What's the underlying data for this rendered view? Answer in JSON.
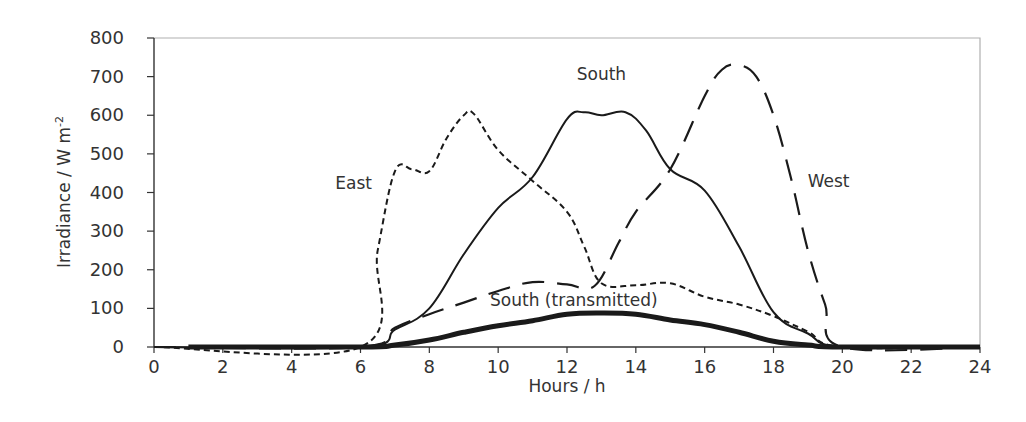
{
  "chart_data": {
    "type": "line",
    "title": "",
    "xlabel": "Hours / h",
    "ylabel": "Irradiance  / W m-2",
    "ylabel_main": "Irradiance  / W m",
    "ylabel_sup": "-2",
    "xlim": [
      0,
      24
    ],
    "ylim": [
      0,
      800
    ],
    "x_ticks": [
      0,
      2,
      4,
      6,
      8,
      10,
      12,
      14,
      16,
      18,
      20,
      22,
      24
    ],
    "y_ticks": [
      0,
      100,
      200,
      300,
      400,
      500,
      600,
      700,
      800
    ],
    "grid": false,
    "legend": "inline labels",
    "series": [
      {
        "name": "South",
        "style": "solid",
        "label_pos": [
          13,
          690
        ],
        "x": [
          0,
          6,
          7,
          8,
          9,
          10,
          11,
          12,
          12.5,
          13,
          13.7,
          14.3,
          15,
          16,
          17,
          18,
          19,
          20,
          24
        ],
        "values": [
          0,
          0,
          45,
          100,
          240,
          360,
          440,
          590,
          608,
          600,
          608,
          560,
          460,
          405,
          260,
          90,
          35,
          0,
          0
        ]
      },
      {
        "name": "East",
        "style": "short-dash",
        "label_pos": [
          5.8,
          410
        ],
        "x": [
          0,
          6,
          6.5,
          7,
          7.5,
          8,
          8.5,
          9,
          9.3,
          10,
          11,
          12,
          12.5,
          13,
          14,
          15,
          16,
          17,
          18,
          19,
          20,
          24
        ],
        "values": [
          0,
          0,
          250,
          455,
          460,
          455,
          540,
          600,
          603,
          510,
          430,
          350,
          260,
          165,
          160,
          165,
          130,
          110,
          80,
          40,
          0,
          0
        ]
      },
      {
        "name": "West",
        "style": "long-dash",
        "label_pos": [
          19.6,
          415
        ],
        "x": [
          0,
          6,
          7,
          8,
          9,
          10,
          11,
          12,
          12.8,
          13.5,
          14,
          15,
          16,
          16.5,
          17,
          17.5,
          18,
          18.5,
          19,
          19.5,
          20,
          24
        ],
        "values": [
          0,
          0,
          50,
          85,
          115,
          145,
          168,
          162,
          158,
          270,
          350,
          460,
          650,
          718,
          730,
          700,
          600,
          440,
          250,
          110,
          0,
          0
        ]
      },
      {
        "name": "South (transmitted)",
        "style": "thick-solid",
        "label_pos": [
          12.2,
          105
        ],
        "x": [
          1,
          6,
          7,
          8,
          9,
          10,
          11,
          12,
          13,
          14,
          15,
          16,
          17,
          18,
          19,
          20,
          24
        ],
        "values": [
          0,
          0,
          5,
          18,
          38,
          55,
          68,
          85,
          88,
          85,
          70,
          58,
          38,
          15,
          5,
          0,
          0
        ]
      }
    ]
  },
  "colors": {
    "line": "#1a1a1a",
    "axis": "#333333",
    "frame": "#b0b0b0",
    "text": "#333333"
  }
}
